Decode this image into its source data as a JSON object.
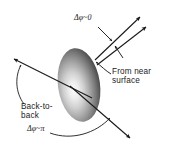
{
  "figure": {
    "type": "physics-schematic-diagram",
    "background_color": "#ffffff",
    "ink_color": "#1a1a1a"
  },
  "labels": {
    "near_side_angle": "Δφ~0",
    "near_side_angle_parts": {
      "delta": "Δ",
      "phi": "φ",
      "relation": "~",
      "value": "0"
    },
    "from_near_surface_line1": "From near",
    "from_near_surface_line2": "surface",
    "back_to_back_line1": "Back-to-",
    "back_to_back_line2": "back",
    "back_to_back_angle": "Δφ~π",
    "back_to_back_angle_parts": {
      "delta": "Δ",
      "phi": "φ",
      "relation": "~",
      "value": "π"
    }
  },
  "shapes": {
    "source_blob": {
      "name": "shaded-ellipse-source",
      "center_x": 79,
      "center_y": 85,
      "radius_x": 21,
      "radius_y": 37,
      "rotation_deg": -8,
      "highlight_x": 70,
      "highlight_y": 88,
      "edge_color": "#141414",
      "mid_color": "#8a8a8a",
      "highlight_color": "#f2f2f2"
    },
    "convergence_point": {
      "x": 95,
      "y": 60
    }
  },
  "arrows": {
    "near_side_upper": {
      "name": "near-side-jet-arrow-upper",
      "x1": 95,
      "y1": 60,
      "x2": 141,
      "y2": 16
    },
    "near_side_lower": {
      "name": "near-side-jet-arrow-lower",
      "x1": 98,
      "y1": 66,
      "x2": 147,
      "y2": 26
    },
    "gap_indicator": {
      "name": "angle-gap-indicator-arrow",
      "x1": 130,
      "y1": 52,
      "x2": 120,
      "y2": 40
    },
    "tick_indicator": {
      "name": "angle-tick-indicator-arrow",
      "x1": 105,
      "y1": 35,
      "x2": 114,
      "y2": 46
    },
    "back_to_back_upper": {
      "name": "back-to-back-arrow-upper-left",
      "x1": 90,
      "y1": 97,
      "x2": 12,
      "y2": 58
    },
    "back_to_back_lower": {
      "name": "back-to-back-arrow-lower-right",
      "x1": 72,
      "y1": 88,
      "x2": 131,
      "y2": 139
    },
    "leader_from_near_surface": {
      "name": "leader-line-from-near-surface",
      "x1": 110,
      "y1": 74,
      "x2": 96,
      "y2": 62
    }
  },
  "brackets": {
    "back_to_back_bracket": {
      "name": "back-to-back-curly-bracket",
      "description": "curved bracket from upper-left arrow down to label"
    },
    "angle_arc": {
      "name": "back-to-back-angle-arc",
      "description": "arc sweeping under the ellipse to the lower-right arrow"
    }
  }
}
